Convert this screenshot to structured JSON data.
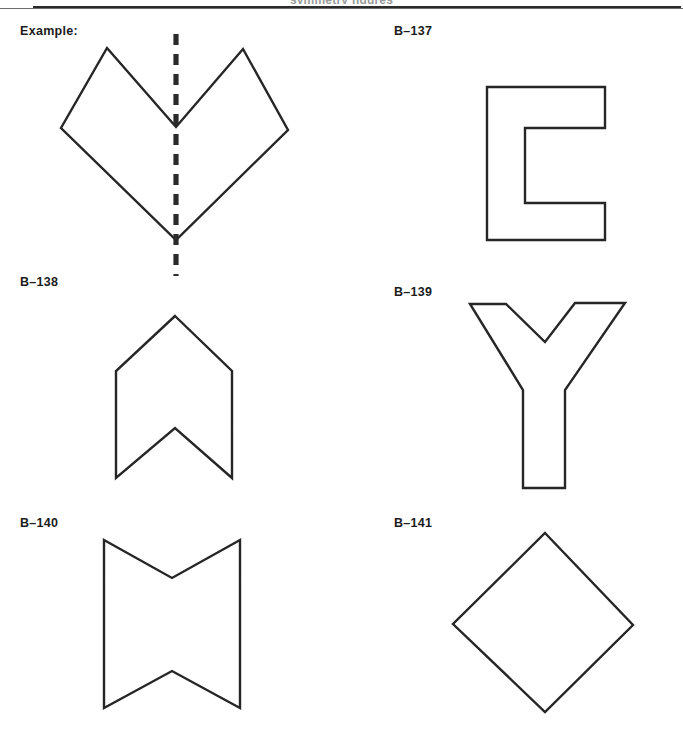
{
  "page": {
    "header_ghost_text": "symmetry figures",
    "background_color": "#ffffff",
    "ink_color": "#262626",
    "width": 683,
    "height": 739
  },
  "cells": [
    {
      "id": "example",
      "label": "Example:",
      "label_x": 20,
      "label_y": 24,
      "figure_name": "double-chevron-heart-with-mirror-line",
      "shape_type": "polygon",
      "points": "107,48 176,127 243,49 288,130 176,240 61,128",
      "mirror_line": {
        "x1": 176,
        "y1": 34,
        "x2": 176,
        "y2": 276
      },
      "has_mirror_line": true
    },
    {
      "id": "b-137",
      "label": "B–137",
      "label_x": 394,
      "label_y": 24,
      "figure_name": "block-letter-c",
      "shape_type": "polygon",
      "points": "487,87 605,87 605,128 525,128 525,203 605,203 605,240 487,240",
      "has_mirror_line": false
    },
    {
      "id": "b-138",
      "label": "B–138",
      "label_x": 20,
      "label_y": 275,
      "figure_name": "banner-chevron-arrow",
      "shape_type": "polygon",
      "points": "175,316 232,371 232,478 175,428 116,478 116,371",
      "has_mirror_line": false
    },
    {
      "id": "b-139",
      "label": "B–139",
      "label_x": 394,
      "label_y": 285,
      "figure_name": "block-letter-y",
      "shape_type": "polygon",
      "points": "470,304 506,304 545,342 575,303 625,303 565,390 565,488 523,488 523,390",
      "has_mirror_line": false
    },
    {
      "id": "b-140",
      "label": "B–140",
      "label_x": 20,
      "label_y": 516,
      "figure_name": "notched-ribbon-bowtie",
      "shape_type": "polygon",
      "points": "104,540 172,578 240,540 240,708 172,671 104,708",
      "has_mirror_line": false
    },
    {
      "id": "b-141",
      "label": "B–141",
      "label_x": 394,
      "label_y": 516,
      "figure_name": "diamond-rhombus",
      "shape_type": "polygon",
      "points": "545,533 633,625 545,712 453,624",
      "has_mirror_line": false
    }
  ]
}
